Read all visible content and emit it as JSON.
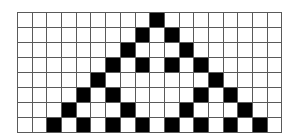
{
  "diagram": {
    "type": "cellular-automaton-grid",
    "cols": 18,
    "rows": 8,
    "colors": {
      "on": "#000000",
      "off": "#ffffff",
      "grid_line": "#5a5a5a"
    },
    "cells": [
      [
        0,
        0,
        0,
        0,
        0,
        0,
        0,
        0,
        0,
        1,
        0,
        0,
        0,
        0,
        0,
        0,
        0,
        0
      ],
      [
        0,
        0,
        0,
        0,
        0,
        0,
        0,
        0,
        1,
        0,
        1,
        0,
        0,
        0,
        0,
        0,
        0,
        0
      ],
      [
        0,
        0,
        0,
        0,
        0,
        0,
        0,
        1,
        0,
        0,
        0,
        1,
        0,
        0,
        0,
        0,
        0,
        0
      ],
      [
        0,
        0,
        0,
        0,
        0,
        0,
        1,
        0,
        1,
        0,
        1,
        0,
        1,
        0,
        0,
        0,
        0,
        0
      ],
      [
        0,
        0,
        0,
        0,
        0,
        1,
        0,
        0,
        0,
        0,
        0,
        0,
        0,
        1,
        0,
        0,
        0,
        0
      ],
      [
        0,
        0,
        0,
        0,
        1,
        0,
        1,
        0,
        0,
        0,
        0,
        0,
        1,
        0,
        1,
        0,
        0,
        0
      ],
      [
        0,
        0,
        0,
        1,
        0,
        0,
        0,
        1,
        0,
        0,
        0,
        1,
        0,
        0,
        0,
        1,
        0,
        0
      ],
      [
        0,
        0,
        1,
        0,
        1,
        0,
        1,
        0,
        1,
        0,
        1,
        0,
        1,
        0,
        1,
        0,
        1,
        0
      ]
    ]
  }
}
